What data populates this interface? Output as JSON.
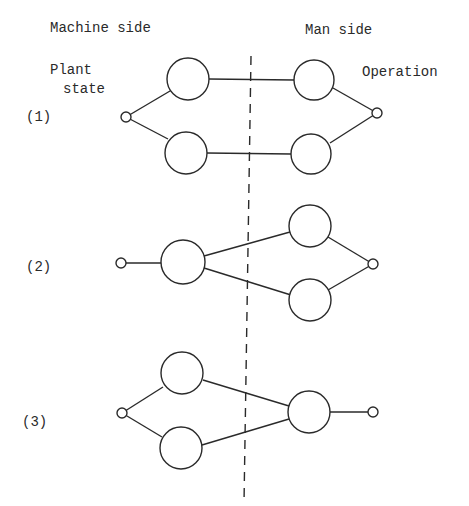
{
  "headers": {
    "machine_side": "Machine side",
    "man_side": "Man side"
  },
  "endpoint_labels": {
    "plant_state_line1": "Plant",
    "plant_state_line2": "state",
    "operation": "Operation"
  },
  "configurations": [
    {
      "id": "1",
      "label": "(1)",
      "description": "Two parallel paths: each machine-side node connects to one man-side node"
    },
    {
      "id": "2",
      "label": "(2)",
      "description": "Single machine-side node branching to two man-side nodes"
    },
    {
      "id": "3",
      "label": "(3)",
      "description": "Two machine-side nodes converging into a single man-side node"
    }
  ],
  "colors": {
    "stroke": "#2a2a2a",
    "background": "#ffffff"
  },
  "divider": {
    "style": "dashed",
    "meaning": "boundary between machine side and man side"
  }
}
